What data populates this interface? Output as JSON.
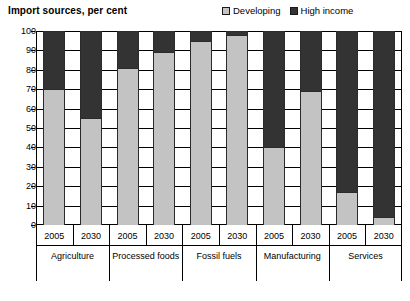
{
  "chart_data": {
    "type": "bar",
    "subtype": "stacked-100-percent",
    "title": "Import sources, per cent",
    "xlabel": "",
    "ylabel": "",
    "ylim": [
      0,
      100
    ],
    "yticks": [
      0,
      10,
      20,
      30,
      40,
      50,
      60,
      70,
      80,
      90,
      100
    ],
    "grid": true,
    "legend_position": "top-right",
    "categories": [
      "Agriculture 2005",
      "Agriculture 2030",
      "Processed foods 2005",
      "Processed foods 2030",
      "Fossil fuels 2005",
      "Fossil fuels 2030",
      "Manufacturing 2005",
      "Manufacturing 2030",
      "Services 2005",
      "Services 2030"
    ],
    "groups": [
      {
        "label": "Agriculture",
        "years": [
          "2005",
          "2030"
        ]
      },
      {
        "label": "Processed foods",
        "years": [
          "2005",
          "2030"
        ]
      },
      {
        "label": "Fossil fuels",
        "years": [
          "2005",
          "2030"
        ]
      },
      {
        "label": "Manufacturing",
        "years": [
          "2005",
          "2030"
        ]
      },
      {
        "label": "Services",
        "years": [
          "2005",
          "2030"
        ]
      }
    ],
    "series": [
      {
        "name": "Developing",
        "color": "#c3c3c3",
        "values": [
          70,
          55,
          81,
          89,
          95,
          98,
          40,
          69,
          17,
          4
        ]
      },
      {
        "name": "High income",
        "color": "#333333",
        "values": [
          30,
          45,
          19,
          11,
          5,
          2,
          60,
          31,
          83,
          96
        ]
      }
    ]
  },
  "legend": {
    "items": [
      {
        "label": "Developing",
        "color": "#c3c3c3"
      },
      {
        "label": "High income",
        "color": "#333333"
      }
    ]
  },
  "axis": {
    "y_tick_labels": [
      "100",
      "90",
      "80",
      "70",
      "60",
      "50",
      "40",
      "30",
      "20",
      "10",
      "0"
    ]
  }
}
